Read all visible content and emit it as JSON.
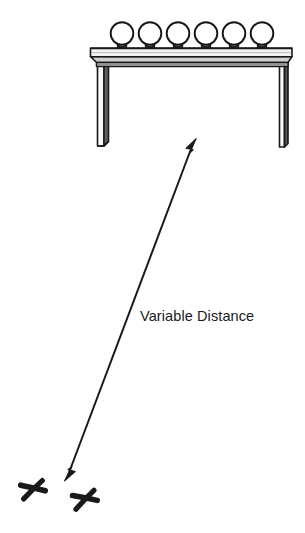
{
  "figure": {
    "title": "",
    "background_color": "#ffffff",
    "ink_color": "#1a1a1c",
    "annotations": {
      "distance_label": "Variable Distance"
    }
  },
  "diagram": {
    "type": "line-art-schematic",
    "table": {
      "name": "table",
      "top_surface": {
        "left": 90,
        "right": 292,
        "top": 48,
        "bottom": 55,
        "fill": "#f2f2f0"
      },
      "front_edge": {
        "left": 97,
        "right": 287,
        "top": 55,
        "bottom": 66,
        "fill": "#d8d8d6"
      },
      "legs": [
        {
          "name": "left-leg",
          "x": 96,
          "y": 60,
          "width": 12,
          "height": 86,
          "front_fill": "#f4f4f2",
          "side_fill": "#6f6f6f"
        },
        {
          "name": "right-leg",
          "x": 279,
          "y": 60,
          "width": 9,
          "height": 86,
          "front_fill": "#f6f6f4",
          "side_fill": "#5e5e5e"
        }
      ]
    },
    "balls": {
      "name": "balls-on-table",
      "count": 6,
      "diameter": 23,
      "fill": "#ffffff",
      "stroke": "#17171a",
      "centers_x": [
        122,
        150,
        178,
        206,
        234,
        262
      ],
      "center_y": 34
    },
    "floor_marks": {
      "name": "floor-x-marks",
      "count": 2,
      "glyph": "x",
      "marks": [
        {
          "cx": 33,
          "cy": 490,
          "size": 26,
          "rotation": -8
        },
        {
          "cx": 85,
          "cy": 500,
          "size": 26,
          "rotation": -10
        }
      ]
    },
    "arrow": {
      "name": "variable-distance-arrow",
      "style": "double-headed",
      "start": {
        "x": 196,
        "y": 139
      },
      "end": {
        "x": 65,
        "y": 480
      },
      "stroke_width": 1.9,
      "color": "#1a1a1c",
      "label": "Variable Distance",
      "label_position": {
        "x": 140,
        "y": 309
      }
    }
  }
}
